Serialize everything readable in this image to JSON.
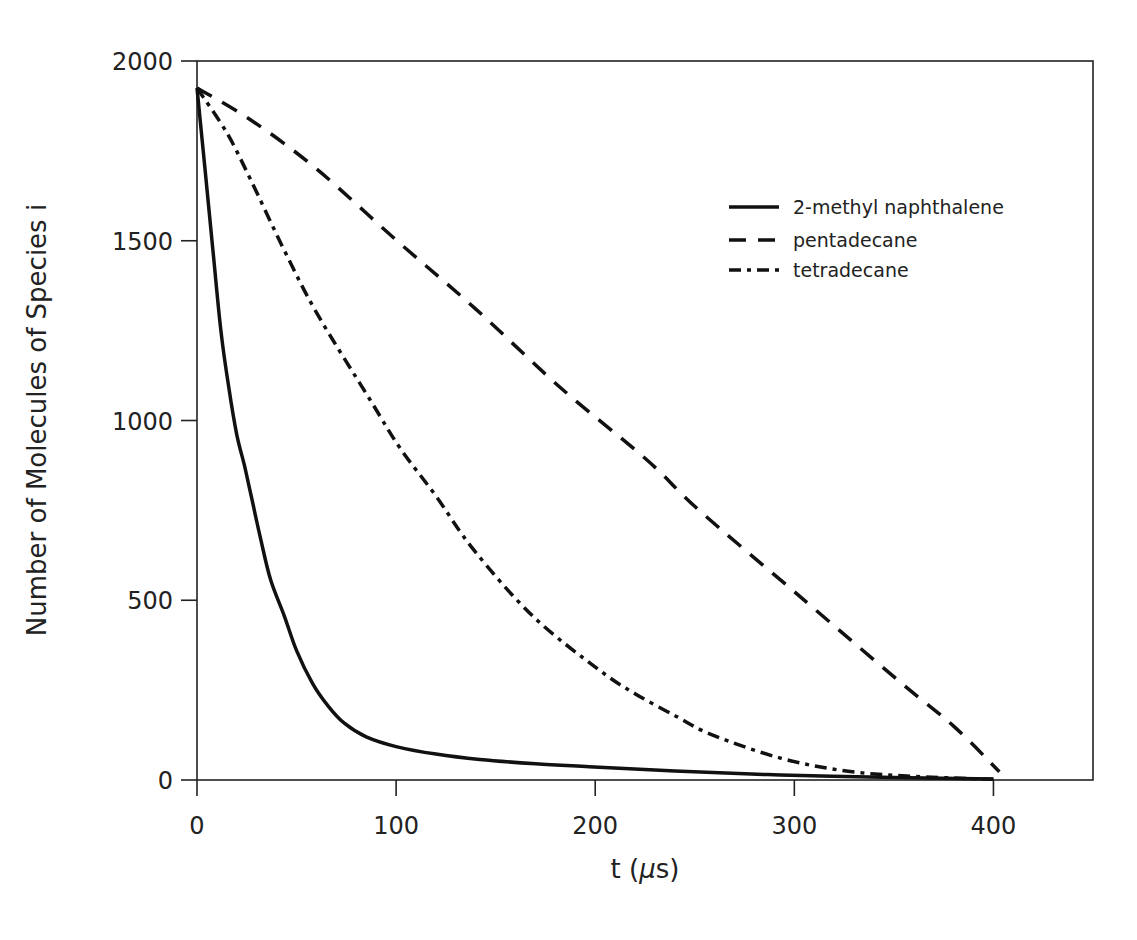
{
  "chart_data": {
    "type": "line",
    "title": "",
    "xlabel": "t (μs)",
    "xlabel_parts": {
      "prefix": "t (",
      "mu": "μ",
      "suffix": "s)"
    },
    "ylabel": "Number of Molecules of Species i",
    "xlim": [
      0,
      450
    ],
    "ylim": [
      0,
      2000
    ],
    "xticks": [
      0,
      100,
      200,
      300,
      400
    ],
    "yticks": [
      0,
      500,
      1000,
      1500,
      2000
    ],
    "grid": false,
    "legend_position": "upper right (inside plot)",
    "series": [
      {
        "name": "2-methyl naphthalene",
        "style": "solid",
        "points": [
          [
            0,
            1925
          ],
          [
            4,
            1700
          ],
          [
            8,
            1474
          ],
          [
            12,
            1250
          ],
          [
            16,
            1090
          ],
          [
            20,
            960
          ],
          [
            24,
            871
          ],
          [
            28,
            770
          ],
          [
            32,
            670
          ],
          [
            37,
            556
          ],
          [
            44,
            454
          ],
          [
            50,
            360
          ],
          [
            58,
            269
          ],
          [
            66,
            205
          ],
          [
            74,
            158
          ],
          [
            85,
            120
          ],
          [
            100,
            93
          ],
          [
            120,
            72
          ],
          [
            142,
            57
          ],
          [
            170,
            45
          ],
          [
            197,
            37
          ],
          [
            240,
            25
          ],
          [
            293,
            14
          ],
          [
            350,
            7
          ],
          [
            400,
            3
          ]
        ]
      },
      {
        "name": "pentadecane",
        "style": "dashed",
        "points": [
          [
            0,
            1925
          ],
          [
            27,
            1836
          ],
          [
            60,
            1700
          ],
          [
            100,
            1502
          ],
          [
            140,
            1310
          ],
          [
            182,
            1094
          ],
          [
            226,
            890
          ],
          [
            252,
            751
          ],
          [
            301,
            519
          ],
          [
            353,
            273
          ],
          [
            380,
            150
          ],
          [
            403,
            23
          ]
        ]
      },
      {
        "name": "tetradecane",
        "style": "dash-dot",
        "points": [
          [
            0,
            1925
          ],
          [
            15,
            1800
          ],
          [
            27,
            1669
          ],
          [
            43,
            1483
          ],
          [
            60,
            1300
          ],
          [
            87,
            1057
          ],
          [
            102,
            923
          ],
          [
            120,
            790
          ],
          [
            139,
            640
          ],
          [
            169,
            454
          ],
          [
            202,
            306
          ],
          [
            220,
            240
          ],
          [
            241,
            176
          ],
          [
            259,
            125
          ],
          [
            293,
            61
          ],
          [
            326,
            25
          ],
          [
            360,
            10
          ],
          [
            400,
            2
          ]
        ]
      }
    ]
  },
  "legend": {
    "items": [
      {
        "label": "2-methyl naphthalene",
        "style": "solid"
      },
      {
        "label": "pentadecane",
        "style": "dashed"
      },
      {
        "label": "tetradecane",
        "style": "dash-dot"
      }
    ]
  },
  "colors": {
    "line": "#111111",
    "axis": "#222222",
    "background": "#ffffff"
  }
}
